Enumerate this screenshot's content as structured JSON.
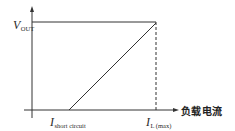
{
  "diagram": {
    "title": "",
    "type": "current-limit foldback characteristic (output voltage vs load current)",
    "y_axis": {
      "label_main": "V",
      "label_sub": "OUT",
      "tick_label": "VOUT"
    },
    "x_axis": {
      "label": "负载电流"
    },
    "markers": [
      {
        "id": "short_circuit",
        "label_main": "I",
        "label_sub": "short circuit"
      },
      {
        "id": "load_max",
        "label_main": "I",
        "label_sub": "L (max)"
      }
    ],
    "segments": [
      {
        "name": "constant-voltage",
        "from": "y-axis at VOUT",
        "to": "I L(max)"
      },
      {
        "name": "limit-slope",
        "from": "I short circuit on x-axis",
        "to": "VOUT at I L(max)"
      },
      {
        "name": "dashed-guide",
        "from": "VOUT at I L(max)",
        "to": "x-axis at I L(max)",
        "style": "dashed"
      }
    ],
    "colors": {
      "line": "#333333",
      "background": "#ffffff"
    }
  }
}
